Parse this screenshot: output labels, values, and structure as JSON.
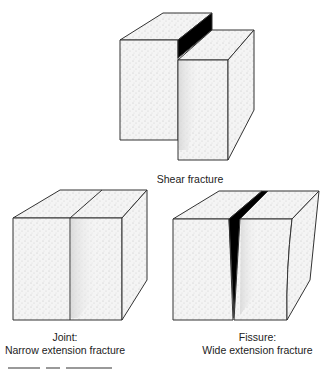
{
  "figure": {
    "panels": [
      {
        "id": "shear",
        "label_lines": [
          "Shear fracture"
        ]
      },
      {
        "id": "joint",
        "label_lines": [
          "Joint:",
          "Narrow extension fracture"
        ]
      },
      {
        "id": "fissure",
        "label_lines": [
          "Fissure:",
          "Wide extension fracture"
        ]
      }
    ]
  },
  "colors": {
    "outline": "#333333",
    "face_light": "#f2f2f2",
    "face_shadow": "#dcdcdc",
    "void": "#000000"
  }
}
